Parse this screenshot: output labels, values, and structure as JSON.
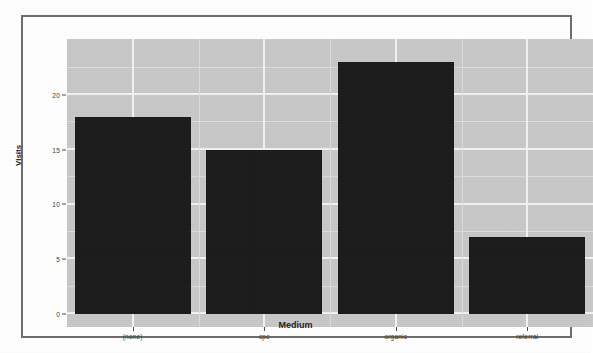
{
  "chart_data": {
    "type": "bar",
    "title": "",
    "subtitle": "",
    "xlabel": "Medium",
    "ylabel": "Visits",
    "categories": [
      "(none)",
      "cpc",
      "organic",
      "referral"
    ],
    "values": [
      18,
      15,
      23,
      7
    ],
    "series": [
      {
        "name": "Visits",
        "values": [
          18,
          15,
          23,
          7
        ]
      }
    ],
    "ylim": [
      0,
      24.2
    ],
    "xlim": [
      0,
      4
    ],
    "y_ticks": [
      0,
      5,
      10,
      15,
      20
    ],
    "y_tick_labels": [
      "0",
      "5",
      "10",
      "15",
      "20"
    ],
    "x_tick_labels": [
      "(none)",
      "cpc",
      "organic",
      "referral"
    ],
    "grid": true,
    "grid_orientation": "both",
    "legend": null,
    "legend_position": "none",
    "bar_color": "#1b1b1b",
    "panel_background": "#c8c8c8",
    "gridline_color": "#f2f2f2",
    "minor_gridline_color": "#dcdcdc",
    "frame_border_color": "#6d6d6d",
    "figure_background": "#ffffff",
    "annotations": []
  },
  "figure": {
    "y_axis_label": "Visits",
    "x_axis_label": "Medium"
  }
}
